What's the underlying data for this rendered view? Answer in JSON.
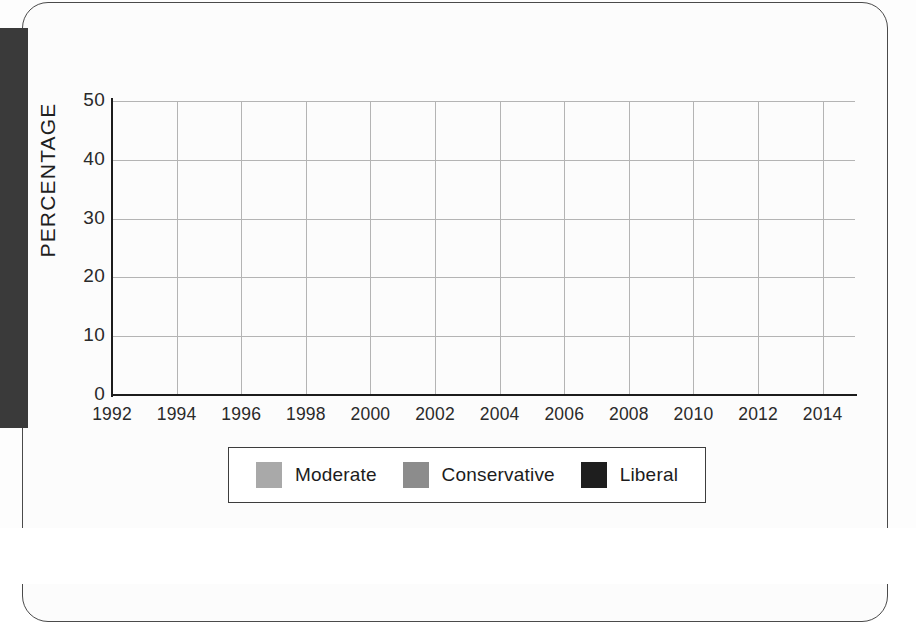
{
  "chart_data": {
    "type": "line",
    "title": "",
    "xlabel": "",
    "ylabel": "PERCENTAGE",
    "xlim": [
      1992,
      2015
    ],
    "ylim": [
      0,
      50
    ],
    "grid": true,
    "legend_position": "bottom",
    "y_ticks": [
      50,
      40,
      30,
      20,
      10,
      0
    ],
    "x_ticks": [
      1992,
      1994,
      1996,
      1998,
      2000,
      2002,
      2004,
      2006,
      2008,
      2010,
      2012,
      2014
    ],
    "x": [
      1992,
      1993,
      1994,
      1995,
      1996,
      1997,
      1998,
      1999,
      2000,
      2001,
      2002,
      2003,
      2004,
      2005,
      2006,
      2007,
      2008,
      2009,
      2010,
      2011,
      2012,
      2013,
      2014,
      2015
    ],
    "series": [
      {
        "name": "Moderate",
        "color": "#a9a9a9",
        "values": [
          36.0,
          38.5,
          40.5,
          36.5,
          38.5,
          39.0,
          39.0,
          39.5,
          40.0,
          40.0,
          40.0,
          39.0,
          40.5,
          39.5,
          39.0,
          38.0,
          37.5,
          41.0,
          41.0,
          41.0,
          40.5,
          40.0,
          38.5,
          38.0
        ]
      },
      {
        "name": "Conservative",
        "color": "#8c8c8c",
        "values": [
          43.5,
          41.5,
          39.0,
          40.0,
          38.0,
          38.5,
          38.5,
          39.0,
          39.5,
          40.0,
          39.5,
          41.0,
          39.5,
          39.0,
          38.5,
          38.0,
          37.5,
          36.0,
          36.0,
          35.5,
          36.0,
          36.5,
          35.0,
          36.0
        ]
      },
      {
        "name": "Liberal",
        "color": "#1e1e1e",
        "values": [
          17.5,
          18.5,
          18.0,
          17.0,
          16.5,
          19.5,
          19.5,
          19.5,
          19.5,
          20.0,
          20.5,
          19.5,
          20.5,
          19.5,
          21.0,
          22.5,
          23.0,
          22.0,
          21.5,
          21.5,
          23.0,
          24.0,
          25.0,
          25.0
        ]
      }
    ]
  },
  "legend": {
    "items": [
      {
        "label": "Moderate",
        "color": "#a9a9a9"
      },
      {
        "label": "Conservative",
        "color": "#8c8c8c"
      },
      {
        "label": "Liberal",
        "color": "#1e1e1e"
      }
    ]
  }
}
